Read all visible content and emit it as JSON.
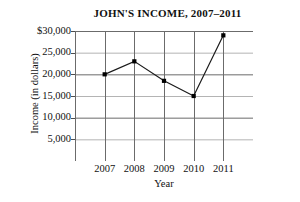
{
  "chart_data": {
    "type": "line",
    "title": "JOHN'S INCOME, 2007–2011",
    "xlabel": "Year",
    "ylabel": "Income (in dollars)",
    "categories": [
      "2007",
      "2008",
      "2009",
      "2010",
      "2011"
    ],
    "values": [
      20000,
      23000,
      18500,
      15000,
      29000
    ],
    "series": [
      {
        "name": "Income",
        "values": [
          20000,
          23000,
          18500,
          15000,
          29000
        ]
      }
    ],
    "ylim": [
      0,
      30000
    ],
    "ytick_values": [
      30000,
      25000,
      20000,
      15000,
      10000,
      5000
    ],
    "ytick_labels": [
      "$30,000",
      "25,000",
      "20,000",
      "15,000",
      "10,000",
      "5,000"
    ],
    "xtick_labels": [
      "2007",
      "2008",
      "2009",
      "2010",
      "2011"
    ],
    "grid": true,
    "legend": "none",
    "line_color": "#1a1a1a",
    "marker_color": "#000000",
    "marker_shape": "square",
    "grid_color_major": "#6b6b6b",
    "grid_color_minor": "#b4b4b4",
    "axis_color": "#4d4d4d",
    "background_color": "#ffffff"
  }
}
